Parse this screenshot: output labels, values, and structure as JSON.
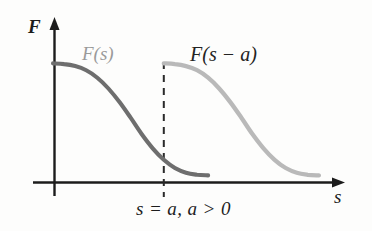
{
  "figure": {
    "background_color": "#fdfdfc",
    "axis_color": "#1c1c1c"
  },
  "axes": {
    "y_label": "F",
    "x_label": "s"
  },
  "annotations": {
    "original_curve_label": "F(s)",
    "shifted_curve_label": "F(s − a)",
    "shift_condition": "s = a, a > 0"
  },
  "chart_data": {
    "type": "line",
    "title": "",
    "xlabel": "s",
    "ylabel": "F",
    "grid": false,
    "legend": "none",
    "xlim": [
      0,
      10
    ],
    "ylim": [
      0,
      1.15
    ],
    "shift": 4,
    "vertical_marker": {
      "x": 4,
      "label": "s = a, a > 0",
      "style": "dashed",
      "color": "#2a2a2a"
    },
    "series": [
      {
        "name": "F(s)",
        "color": "#6e6e6e",
        "label_position": {
          "x": 1.7,
          "y": 0.9
        },
        "x": [
          0,
          0.4,
          0.8,
          1.2,
          1.6,
          2.0,
          2.4,
          2.8,
          3.2,
          3.6,
          4.0,
          4.4,
          4.8,
          5.2,
          5.6
        ],
        "y": [
          0.86,
          0.855,
          0.84,
          0.81,
          0.755,
          0.675,
          0.575,
          0.46,
          0.34,
          0.235,
          0.15,
          0.09,
          0.055,
          0.04,
          0.035
        ]
      },
      {
        "name": "F(s - a)",
        "color": "#b9b9b9",
        "label_position": {
          "x": 5.6,
          "y": 0.9
        },
        "x": [
          4.0,
          4.4,
          4.8,
          5.2,
          5.6,
          6.0,
          6.4,
          6.8,
          7.2,
          7.6,
          8.0,
          8.4,
          8.8,
          9.2,
          9.6
        ],
        "y": [
          0.86,
          0.855,
          0.84,
          0.81,
          0.755,
          0.675,
          0.575,
          0.46,
          0.34,
          0.235,
          0.15,
          0.09,
          0.055,
          0.04,
          0.035
        ]
      }
    ]
  }
}
